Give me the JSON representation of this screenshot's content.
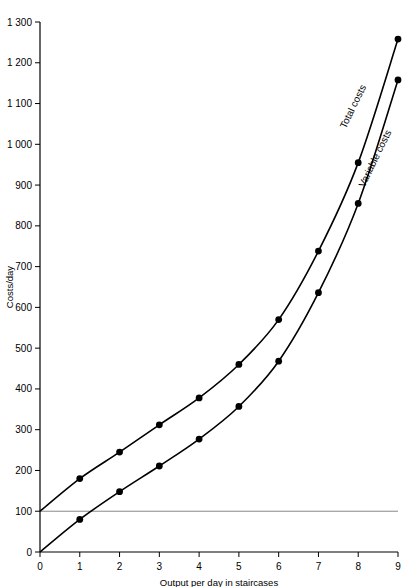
{
  "chart_data": {
    "type": "line",
    "title": "",
    "xlabel": "Output per day in staircases",
    "ylabel": "Costs/day",
    "xlim": [
      0,
      9
    ],
    "ylim": [
      0,
      1300
    ],
    "grid": false,
    "legend_position": "inline-curve-labels",
    "x": [
      0,
      1,
      2,
      3,
      4,
      5,
      6,
      7,
      8,
      9
    ],
    "xtick_labels": [
      "0",
      "1",
      "2",
      "3",
      "4",
      "5",
      "6",
      "7",
      "8",
      "9"
    ],
    "ytick_values": [
      0,
      100,
      200,
      300,
      400,
      500,
      600,
      700,
      800,
      900,
      1000,
      1100,
      1200,
      1300
    ],
    "ytick_labels": [
      "0",
      "100",
      "200",
      "300",
      "400",
      "500",
      "600",
      "700",
      "800",
      "900",
      "1 000",
      "1 100",
      "1 200",
      "1 300"
    ],
    "series": [
      {
        "name": "Total costs",
        "label": "Total costs",
        "color": "#000000",
        "marker": "filled-circle",
        "values": [
          100,
          180,
          245,
          312,
          378,
          460,
          570,
          738,
          955,
          1258
        ],
        "marker_x": [
          1,
          2,
          3,
          4,
          5,
          6,
          7,
          8,
          9
        ],
        "marker_values": [
          180,
          245,
          312,
          378,
          460,
          570,
          738,
          955,
          1258
        ]
      },
      {
        "name": "Variable costs",
        "label": "Variable costs",
        "color": "#000000",
        "marker": "filled-circle",
        "values": [
          0,
          80,
          148,
          211,
          277,
          357,
          468,
          636,
          855,
          1158
        ],
        "marker_x": [
          1,
          2,
          3,
          4,
          5,
          6,
          7,
          8,
          9
        ],
        "marker_values": [
          80,
          148,
          211,
          277,
          357,
          468,
          636,
          855,
          1158
        ]
      }
    ],
    "reference_lines": [
      {
        "name": "fixed-costs-line",
        "orientation": "horizontal",
        "value": 100,
        "color": "#888888"
      }
    ]
  }
}
